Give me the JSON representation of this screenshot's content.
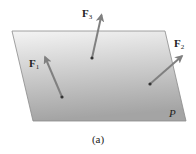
{
  "diagram": {
    "plane": {
      "label": "P",
      "corners": [
        [
          12,
          31
        ],
        [
          165,
          31
        ],
        [
          186,
          121
        ],
        [
          33,
          121
        ]
      ],
      "fill_top": "#f2f2f2",
      "fill_bottom": "#a6a6a6",
      "edge_color": "#8a8a8a"
    },
    "forces": [
      {
        "name": "F",
        "subscript": "1",
        "tail": [
          62,
          97
        ],
        "head": [
          45,
          56
        ],
        "label_pos": [
          29,
          67
        ]
      },
      {
        "name": "F",
        "subscript": "3",
        "tail": [
          92,
          58
        ],
        "head": [
          102,
          14
        ],
        "label_pos": [
          82,
          17
        ]
      },
      {
        "name": "F",
        "subscript": "2",
        "tail": [
          150,
          84
        ],
        "head": [
          183,
          55
        ],
        "label_pos": [
          174,
          47
        ]
      }
    ],
    "arrow_color": "#808080",
    "point_color": "#333333",
    "caption": "(a)"
  }
}
